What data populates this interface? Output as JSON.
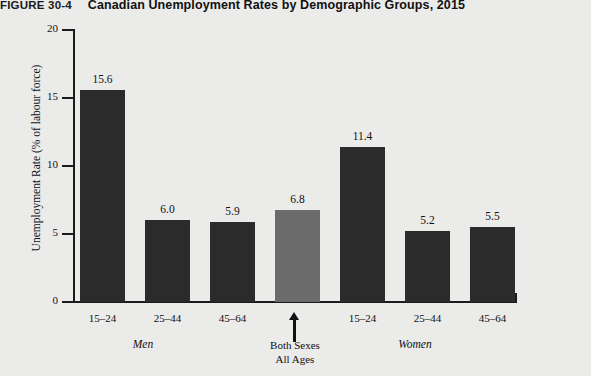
{
  "figure": {
    "label": "FIGURE 30-4",
    "caption": "Canadian Unemployment Rates by Demographic Groups, 2015"
  },
  "colors": {
    "background": "#ebebea",
    "bar_dark": "#2b2b2b",
    "bar_gray": "#6b6b6b",
    "axis": "#1b1b1b",
    "text": "#111111"
  },
  "annotation": {
    "line1": "Both Sexes",
    "line2": "All Ages"
  },
  "groups": {
    "men": "Men",
    "women": "Women"
  },
  "chart_data": {
    "type": "bar",
    "title": "Canadian Unemployment Rates by Demographic Groups, 2015",
    "xlabel": "",
    "ylabel": "Unemployment Rate (% of labour force)",
    "ylim": [
      0,
      20
    ],
    "yticks": [
      0,
      5,
      10,
      15,
      20
    ],
    "ytick_labels": [
      "0",
      "5",
      "10",
      "15",
      "20"
    ],
    "grid": false,
    "legend": "none",
    "categories": [
      "15–24",
      "25–44",
      "45–64",
      "",
      "15–24",
      "25–44",
      "45–64"
    ],
    "values": [
      15.6,
      6.0,
      5.9,
      6.8,
      11.4,
      5.2,
      5.5
    ],
    "value_labels": [
      "15.6",
      "6.0",
      "5.9",
      "6.8",
      "11.4",
      "5.2",
      "5.5"
    ],
    "bar_colors": [
      "#2b2b2b",
      "#2b2b2b",
      "#2b2b2b",
      "#6b6b6b",
      "#2b2b2b",
      "#2b2b2b",
      "#2b2b2b"
    ],
    "group_labels": [
      "Men",
      "Both Sexes All Ages",
      "Women"
    ],
    "annotations": [
      {
        "text": "Both Sexes All Ages",
        "points_to": "bar-4",
        "style": "up-arrow"
      }
    ]
  }
}
